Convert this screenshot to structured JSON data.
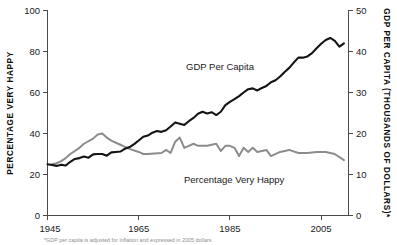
{
  "chart_data": {
    "type": "line",
    "title": "",
    "xlabel": "",
    "ylabel": "PERCENTAGE VERY HAPPY",
    "y2label": "GDP PER CAPITA (THOUSANDS OF DOLLARS)*",
    "grid": false,
    "legend_position": "inline-annotation",
    "xlim": [
      1945,
      2011
    ],
    "ylim": [
      0,
      100
    ],
    "y2lim": [
      0,
      50
    ],
    "xticks": [
      1945,
      1965,
      1985,
      2005
    ],
    "xtick_labels": [
      "1945",
      "1965",
      "1985",
      "2005"
    ],
    "yticks": [
      0,
      20,
      40,
      60,
      80,
      100
    ],
    "ytick_labels": [
      "0",
      "20",
      "40",
      "60",
      "80",
      "100"
    ],
    "y2ticks": [
      0,
      10,
      20,
      30,
      40,
      50
    ],
    "y2tick_labels": [
      "0",
      "10",
      "20",
      "30",
      "40",
      "50"
    ],
    "series": [
      {
        "name": "GDP Per Capita",
        "axis": "right",
        "color": "#141414",
        "units": "thousands of 2005 dollars",
        "x": [
          1945,
          1946,
          1947,
          1948,
          1949,
          1950,
          1951,
          1952,
          1953,
          1954,
          1955,
          1956,
          1957,
          1958,
          1959,
          1960,
          1961,
          1962,
          1963,
          1964,
          1965,
          1966,
          1967,
          1968,
          1969,
          1970,
          1971,
          1972,
          1973,
          1974,
          1975,
          1976,
          1977,
          1978,
          1979,
          1980,
          1981,
          1982,
          1983,
          1984,
          1985,
          1986,
          1987,
          1988,
          1989,
          1990,
          1991,
          1992,
          1993,
          1994,
          1995,
          1996,
          1997,
          1998,
          1999,
          2000,
          2001,
          2002,
          2003,
          2004,
          2005,
          2006,
          2007,
          2008,
          2009,
          2010
        ],
        "values": [
          12.5,
          12.3,
          12.1,
          12.4,
          12.2,
          13.1,
          13.8,
          14.0,
          14.4,
          14.1,
          14.9,
          15.0,
          15.0,
          14.6,
          15.4,
          15.5,
          15.6,
          16.3,
          16.7,
          17.4,
          18.3,
          19.2,
          19.5,
          20.2,
          20.6,
          20.4,
          20.8,
          21.7,
          22.7,
          22.4,
          22.1,
          23.0,
          23.8,
          24.8,
          25.3,
          24.9,
          25.2,
          24.5,
          25.3,
          26.9,
          27.7,
          28.4,
          29.1,
          30.0,
          30.8,
          31.0,
          30.5,
          31.1,
          31.6,
          32.5,
          33.0,
          33.9,
          35.0,
          36.0,
          37.3,
          38.5,
          38.5,
          38.8,
          39.6,
          40.8,
          41.9,
          42.8,
          43.3,
          42.6,
          41.2,
          42.0
        ]
      },
      {
        "name": "Percentage Very Happy",
        "axis": "left",
        "color": "#8c8c8c",
        "units": "percent",
        "x": [
          1946,
          1947,
          1948,
          1949,
          1950,
          1952,
          1953,
          1955,
          1956,
          1957,
          1958,
          1959,
          1960,
          1961,
          1962,
          1963,
          1965,
          1966,
          1967,
          1970,
          1971,
          1972,
          1973,
          1974,
          1975,
          1976,
          1977,
          1978,
          1980,
          1982,
          1983,
          1984,
          1985,
          1986,
          1987,
          1988,
          1989,
          1990,
          1991,
          1993,
          1994,
          1996,
          1998,
          2000,
          2002,
          2004,
          2006,
          2008,
          2010
        ],
        "values": [
          25.0,
          25.5,
          26.5,
          28.0,
          30.0,
          33.0,
          35.0,
          37.5,
          39.5,
          40.0,
          38.0,
          36.5,
          35.5,
          34.5,
          33.5,
          32.5,
          31.0,
          30.0,
          30.0,
          30.5,
          32.0,
          30.5,
          36.0,
          38.0,
          33.0,
          34.0,
          35.0,
          34.0,
          34.0,
          35.0,
          31.5,
          34.0,
          34.0,
          33.0,
          29.0,
          33.0,
          31.0,
          33.0,
          31.0,
          32.0,
          29.0,
          31.0,
          32.0,
          30.5,
          30.5,
          31.0,
          31.0,
          30.0,
          27.0
        ]
      }
    ],
    "annotations": [
      {
        "text": "GDP Per Capita",
        "x": 1976,
        "y_left": 72
      },
      {
        "text": "Percentage Very Happy",
        "x": 1990,
        "y_left": 18
      }
    ]
  },
  "axes": {
    "left_title": "PERCENTAGE VERY HAPPY",
    "right_title": "GDP PER CAPITA (THOUSANDS OF DOLLARS)*"
  },
  "footnote": {
    "text": "*GDP per capita is adjusted for inflation and expressed in 2005 dollars."
  }
}
